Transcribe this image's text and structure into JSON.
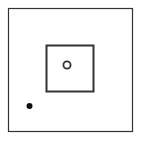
{
  "diagram": {
    "background": "#ffffff",
    "stroke_color": "#333333",
    "outer_square": {
      "x": 8.5,
      "y": 8.5,
      "width": 124,
      "height": 123,
      "stroke_width": 1.2
    },
    "inner_square": {
      "x": 46.5,
      "y": 45.5,
      "width": 47,
      "height": 46,
      "stroke_width": 2
    },
    "hollow_circle": {
      "cx": 67,
      "cy": 65,
      "r": 3.6,
      "stroke_width": 1.8
    },
    "filled_dot": {
      "cx": 29.5,
      "cy": 106,
      "r": 3,
      "fill": "#111111"
    }
  }
}
